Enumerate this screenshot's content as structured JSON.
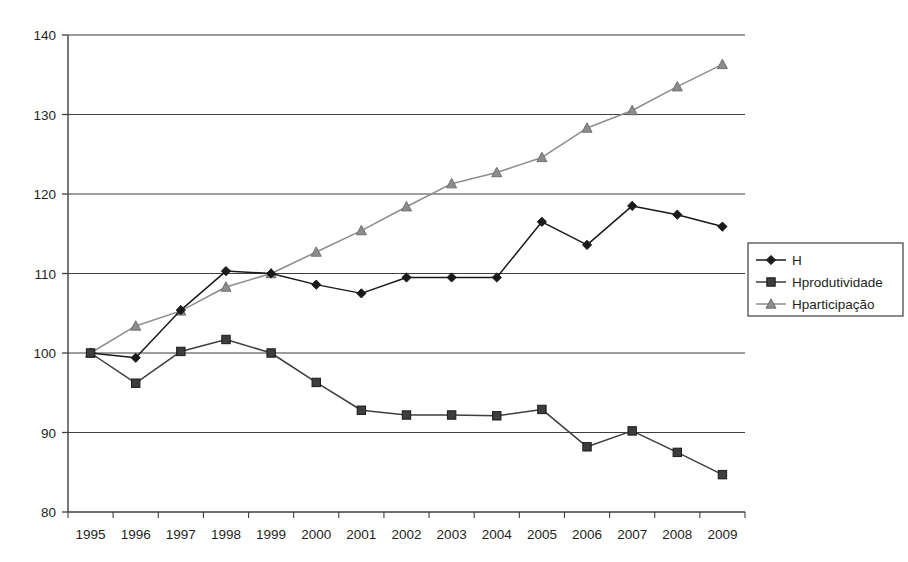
{
  "chart_data": {
    "type": "line",
    "title": "",
    "subtitle": "",
    "xlabel": "",
    "ylabel": "",
    "categories": [
      "1995",
      "1996",
      "1997",
      "1998",
      "1999",
      "2000",
      "2001",
      "2002",
      "2003",
      "2004",
      "2005",
      "2006",
      "2007",
      "2008",
      "2009"
    ],
    "ylim": [
      80,
      140
    ],
    "ytick_values": [
      80,
      90,
      100,
      110,
      120,
      130,
      140
    ],
    "ytick_labels": [
      "80",
      "90",
      "100",
      "110",
      "120",
      "130",
      "140"
    ],
    "grid": "horizontal",
    "legend_position": "right",
    "series": [
      {
        "name": "H",
        "marker": "diamond",
        "color": "#1a1a1a",
        "values": [
          100.0,
          99.4,
          105.4,
          110.3,
          110.0,
          108.6,
          107.5,
          109.5,
          109.5,
          109.5,
          116.5,
          113.6,
          118.5,
          117.4,
          115.9
        ]
      },
      {
        "name": "Hprodutividade",
        "marker": "square",
        "color": "#3d3d3d",
        "values": [
          100.0,
          96.2,
          100.2,
          101.7,
          100.0,
          96.3,
          92.8,
          92.2,
          92.2,
          92.1,
          92.9,
          88.2,
          90.2,
          87.5,
          84.7
        ]
      },
      {
        "name": "Hparticipação",
        "marker": "triangle",
        "color": "#8c8c8c",
        "values": [
          100.0,
          103.4,
          105.3,
          108.3,
          110.0,
          112.7,
          115.4,
          118.4,
          121.3,
          122.7,
          124.6,
          128.3,
          130.5,
          133.5,
          136.3
        ]
      }
    ]
  },
  "legend": {
    "items": [
      {
        "label": "H"
      },
      {
        "label": "Hprodutividade"
      },
      {
        "label": "Hparticipação"
      }
    ]
  }
}
